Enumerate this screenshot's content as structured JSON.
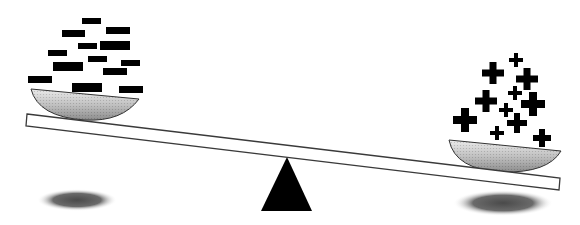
{
  "illustration": {
    "subject": "balance-scale",
    "left_pan": {
      "symbol": "minus",
      "count": 13,
      "items": [
        {
          "x": 82,
          "y": 18,
          "w": 19,
          "h": 6
        },
        {
          "x": 62,
          "y": 30,
          "w": 23,
          "h": 7
        },
        {
          "x": 106,
          "y": 27,
          "w": 24,
          "h": 7
        },
        {
          "x": 78,
          "y": 43,
          "w": 19,
          "h": 6
        },
        {
          "x": 100,
          "y": 41,
          "w": 30,
          "h": 9
        },
        {
          "x": 48,
          "y": 50,
          "w": 19,
          "h": 6
        },
        {
          "x": 88,
          "y": 56,
          "w": 19,
          "h": 6
        },
        {
          "x": 121,
          "y": 60,
          "w": 19,
          "h": 6
        },
        {
          "x": 53,
          "y": 62,
          "w": 30,
          "h": 9
        },
        {
          "x": 103,
          "y": 68,
          "w": 24,
          "h": 7
        },
        {
          "x": 28,
          "y": 76,
          "w": 24,
          "h": 7
        },
        {
          "x": 72,
          "y": 83,
          "w": 30,
          "h": 9
        },
        {
          "x": 119,
          "y": 86,
          "w": 24,
          "h": 7
        }
      ]
    },
    "right_pan": {
      "symbol": "plus",
      "count": 12,
      "items": [
        {
          "cx": 516,
          "cy": 60,
          "s": 14
        },
        {
          "cx": 493,
          "cy": 73,
          "s": 22
        },
        {
          "cx": 527,
          "cy": 79,
          "s": 22
        },
        {
          "cx": 515,
          "cy": 93,
          "s": 14
        },
        {
          "cx": 486,
          "cy": 101,
          "s": 22
        },
        {
          "cx": 533,
          "cy": 104,
          "s": 24
        },
        {
          "cx": 506,
          "cy": 110,
          "s": 14
        },
        {
          "cx": 465,
          "cy": 120,
          "s": 24
        },
        {
          "cx": 517,
          "cy": 123,
          "s": 20
        },
        {
          "cx": 497,
          "cy": 133,
          "s": 14
        },
        {
          "cx": 542,
          "cy": 138,
          "s": 18
        }
      ]
    },
    "colors": {
      "ink": "#000000",
      "beam_fill": "#ffffff",
      "beam_stroke": "#3a3a3a",
      "pan_light": "#e6e6e6",
      "pan_dark": "#8a8a8a",
      "shadow": "#555555",
      "background": "#ffffff"
    }
  }
}
